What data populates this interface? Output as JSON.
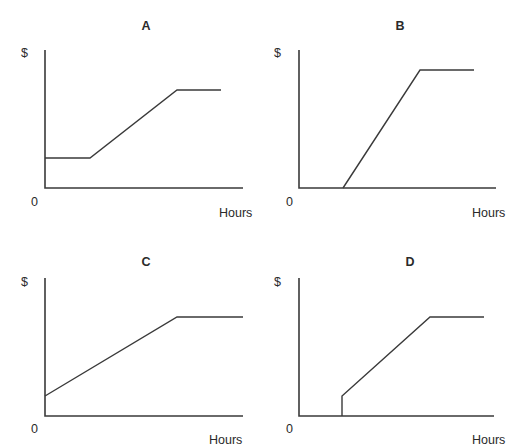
{
  "figure": {
    "axis_color": "#3a3a3a",
    "line_color": "#3a3a3a"
  },
  "chart_data": [
    {
      "id": "A",
      "type": "line",
      "title": "A",
      "xlabel": "Hours",
      "ylabel": "$",
      "origin_label": "0",
      "grid": false,
      "legend": null,
      "data_normalized": {
        "x": [
          0,
          0.23,
          0.67,
          0.89
        ],
        "y": [
          0.22,
          0.22,
          0.71,
          0.71
        ]
      },
      "description": "Flat at a positive fixed amount, then rises linearly, then flat (capped)",
      "layout": {
        "title_pos": [
          146,
          20
        ],
        "ylabel_pos": [
          21,
          47
        ],
        "origin_pos": [
          31,
          196
        ],
        "xlabel_pos": [
          219,
          207
        ],
        "axis": {
          "x0": 45,
          "y_top": 50,
          "y0": 188,
          "x_end": 243
        },
        "points": [
          [
            45,
            158
          ],
          [
            90,
            158
          ],
          [
            177,
            90
          ],
          [
            221,
            90
          ]
        ]
      }
    },
    {
      "id": "B",
      "type": "line",
      "title": "B",
      "xlabel": "Hours",
      "ylabel": "$",
      "origin_label": "0",
      "grid": false,
      "legend": null,
      "data_normalized": {
        "x": [
          0,
          0.22,
          0.62,
          0.89
        ],
        "y": [
          0,
          0,
          0.86,
          0.86
        ]
      },
      "description": "Zero until a threshold, then steep linear rise, then flat (capped)",
      "layout": {
        "title_pos": [
          400,
          20
        ],
        "ylabel_pos": [
          274,
          47
        ],
        "origin_pos": [
          286,
          196
        ],
        "xlabel_pos": [
          472,
          207
        ],
        "axis": {
          "x0": 299,
          "y_top": 50,
          "y0": 188,
          "x_end": 496
        },
        "points": [
          [
            343,
            188
          ],
          [
            420,
            70
          ],
          [
            474,
            70
          ]
        ]
      }
    },
    {
      "id": "C",
      "type": "line",
      "title": "C",
      "xlabel": "Hours",
      "ylabel": "$",
      "origin_label": "0",
      "grid": false,
      "legend": null,
      "data_normalized": {
        "x": [
          0,
          0.67,
          1.0
        ],
        "y": [
          0.14,
          0.72,
          0.72
        ]
      },
      "description": "Starts at a small positive amount, rises linearly, then flat (capped)",
      "layout": {
        "title_pos": [
          146,
          256
        ],
        "ylabel_pos": [
          21,
          276
        ],
        "origin_pos": [
          31,
          423
        ],
        "xlabel_pos": [
          209,
          434
        ],
        "axis": {
          "x0": 45,
          "y_top": 278,
          "y0": 416,
          "x_end": 243
        },
        "points": [
          [
            45,
            396
          ],
          [
            177,
            317
          ],
          [
            243,
            317
          ]
        ]
      }
    },
    {
      "id": "D",
      "type": "line",
      "title": "D",
      "xlabel": "Hours",
      "ylabel": "$",
      "origin_label": "0",
      "grid": false,
      "legend": null,
      "data_normalized": {
        "x": [
          0,
          0.22,
          0.22,
          0.66,
          0.94
        ],
        "y": [
          0,
          0,
          0.14,
          0.72,
          0.72
        ]
      },
      "description": "Zero until a threshold, jumps to a small amount, rises linearly, then flat (capped)",
      "layout": {
        "title_pos": [
          410,
          256
        ],
        "ylabel_pos": [
          274,
          276
        ],
        "origin_pos": [
          286,
          423
        ],
        "xlabel_pos": [
          472,
          434
        ],
        "axis": {
          "x0": 299,
          "y_top": 278,
          "y0": 416,
          "x_end": 494
        },
        "points": [
          [
            342,
            416
          ],
          [
            342,
            396
          ],
          [
            430,
            317
          ],
          [
            484,
            317
          ]
        ]
      }
    }
  ]
}
